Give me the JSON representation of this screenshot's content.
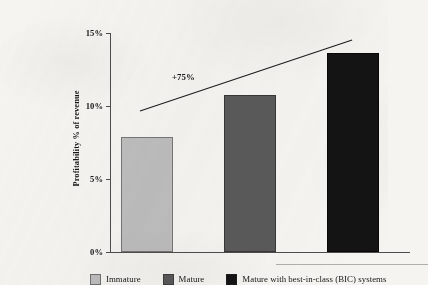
{
  "chart_data": {
    "type": "bar",
    "title": "",
    "subtitle": "",
    "xlabel": "",
    "ylabel": "Profitability % of revenue",
    "categories": [
      "Immature",
      "Mature",
      "Mature with best-in-class (BIC) systems"
    ],
    "values": [
      7.9,
      10.75,
      13.6
    ],
    "ylim": [
      0,
      15
    ],
    "yticks": [
      0,
      5,
      10,
      15
    ],
    "ytick_labels": [
      "0%",
      "5%",
      "10%",
      "15%"
    ],
    "grid": false,
    "legend_position": "bottom",
    "series": [
      {
        "name": "Profitability % of revenue",
        "values": [
          7.9,
          10.75,
          13.6
        ]
      }
    ],
    "annotations": [
      {
        "text": "+75%",
        "type": "trend-growth-label",
        "x_pct": 20.7,
        "y_pct": 17.8
      },
      {
        "text": "",
        "type": "trend-line",
        "from": {
          "x_pct": 10.0,
          "y_pct": 35.6
        },
        "to": {
          "x_pct": 80.7,
          "y_pct": 3.2
        }
      }
    ],
    "colors": {
      "bar_immature": "#bdbdbd",
      "bar_mature": "#5a5a5a",
      "bar_mature_bic": "#141414",
      "axis": "#4d4d4d",
      "text": "#161616",
      "background": "#f5f4f1"
    }
  },
  "axis": {
    "y_title": "Profitability % of revenue",
    "ticks": [
      {
        "label": "15%",
        "value": 15
      },
      {
        "label": "10%",
        "value": 10
      },
      {
        "label": "5%",
        "value": 5
      },
      {
        "label": "0%",
        "value": 0
      }
    ]
  },
  "annotation": {
    "growth_label": "+75%"
  },
  "legend": {
    "items": [
      {
        "label": "Immature",
        "color": "#bdbdbd"
      },
      {
        "label": "Mature",
        "color": "#5a5a5a"
      },
      {
        "label": "Mature with best-in-class (BIC) systems",
        "color": "#141414"
      }
    ]
  }
}
